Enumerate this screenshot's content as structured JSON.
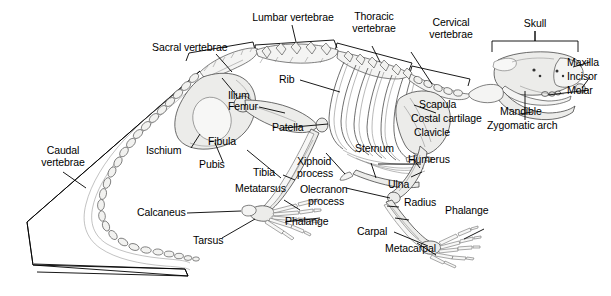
{
  "figure": {
    "background_color": "#ffffff",
    "line_color": "#000000",
    "bone_fill": "#f4f4f3"
  },
  "labels": {
    "lumbar_vertebrae": "Lumbar vertebrae",
    "thoracic_vertebrae_l1": "Thoracic",
    "thoracic_vertebrae_l2": "vertebrae",
    "cervical_vertebrae_l1": "Cervical",
    "cervical_vertebrae_l2": "vertebrae",
    "skull": "Skull",
    "sacral_vertebrae": "Sacral vertebrae",
    "rib": "Rib",
    "maxilla": "Maxilla",
    "incisor": "Incisor",
    "molar": "Molar",
    "mandible": "Mandible",
    "zygomatic_arch": "Zygomatic arch",
    "ilium": "Ilium",
    "femur": "Femur",
    "patella": "Patella",
    "scapula": "Scapula",
    "costal_cartilage": "Costal cartilage",
    "clavicle": "Clavicle",
    "fibula": "Fibula",
    "tibia": "Tibia",
    "pubis": "Pubis",
    "ischium": "Ischium",
    "sternum": "Sternum",
    "humerus": "Humerus",
    "xiphoid_process_l1": "Xiphoid",
    "xiphoid_process_l2": "process",
    "olecranon_process_l1": "Olecranon",
    "olecranon_process_l2": "process",
    "ulna": "Ulna",
    "radius": "Radius",
    "caudal_vertebrae_l1": "Caudal",
    "caudal_vertebrae_l2": "vertebrae",
    "metatarsus": "Metatarsus",
    "calcaneus": "Calcaneus",
    "tarsus": "Tarsus",
    "phalange_hind": "Phalange",
    "phalange_fore": "Phalange",
    "carpal": "Carpal",
    "metacarpal": "Metacarpal"
  }
}
